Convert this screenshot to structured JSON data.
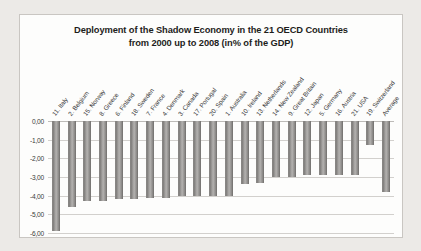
{
  "chart_data": {
    "type": "bar",
    "title": "Deployment of the Shadow Economy in the 21 OECD Countries from 2000 up to 2008  (in% of the GDP)",
    "title_line1": "Deployment of the Shadow Economy in the 21 OECD Countries",
    "title_line2": "from 2000 up to 2008  (in% of the GDP)",
    "xlabel": "",
    "ylabel": "",
    "ylim": [
      -6.0,
      0.0
    ],
    "grid": true,
    "legend": "none",
    "ytick_labels": [
      "0,00",
      "-1,00",
      "-2,00",
      "-3,00",
      "-4,00",
      "-5,00",
      "-6,00"
    ],
    "ytick_values": [
      0.0,
      -1.0,
      -2.0,
      -3.0,
      -4.0,
      -5.0,
      -6.0
    ],
    "categories": [
      "11. Italy",
      "2. Belgium",
      "15. Norway",
      "8. Greece",
      "6. Finland",
      "18. Sweden",
      "7. France",
      "4. Denmark",
      "3. Canada",
      "17. Portugal",
      "20. Spain",
      "1. Australia",
      "10. Ireland",
      "13. Netherlands",
      "14. New Zealand",
      "9. Great Britain",
      "12. Japan",
      "5. Germany",
      "16. Austria",
      "21. USA",
      "19. Switzerland",
      "Average"
    ],
    "values": [
      -5.9,
      -4.6,
      -4.3,
      -4.3,
      -4.2,
      -4.2,
      -4.1,
      -4.1,
      -4.0,
      -4.0,
      -4.0,
      -4.0,
      -3.4,
      -3.3,
      -3.0,
      -3.0,
      -2.9,
      -2.9,
      -2.9,
      -2.9,
      -1.3,
      -3.8
    ]
  }
}
